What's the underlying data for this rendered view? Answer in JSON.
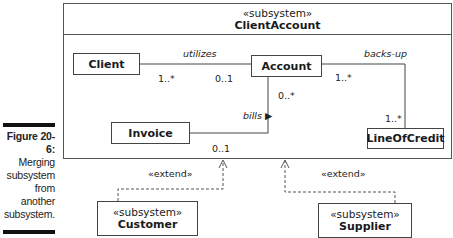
{
  "caption": {
    "figure_label": "Figure 20-6:",
    "lines": [
      "Merging",
      "subsystem",
      "from",
      "another",
      "subsystem."
    ]
  },
  "container": {
    "stereotype": "«subsystem»",
    "name": "ClientAccount"
  },
  "classes": {
    "client": "Client",
    "account": "Account",
    "invoice": "Invoice",
    "line_of_credit": "LineOfCredit"
  },
  "associations": {
    "utilizes": {
      "name": "utilizes",
      "client_mult": "1..*",
      "account_mult": "0..1"
    },
    "backs_up": {
      "name": "backs-up",
      "account_mult": "1..*",
      "loc_mult": "1..*"
    },
    "bills": {
      "name": "bills ▶",
      "account_mult": "0..*",
      "invoice_mult": "0..1"
    }
  },
  "extensions": {
    "customer": {
      "label": "«extend»",
      "stereotype": "«subsystem»",
      "name": "Customer"
    },
    "supplier": {
      "label": "«extend»",
      "stereotype": "«subsystem»",
      "name": "Supplier"
    }
  }
}
